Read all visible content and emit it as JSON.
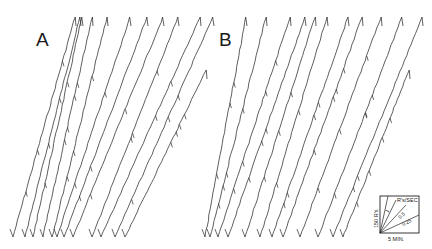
{
  "header": {
    "page_number": "",
    "running_title": ""
  },
  "panels": [
    {
      "label": "A"
    },
    {
      "label": "B"
    }
  ],
  "legend": {
    "y_scale_label": "150 R's",
    "x_scale_label": "5 MIN.",
    "rate_title": "R's/SEC",
    "rate_lines": [
      "1",
      "0.5",
      "0.25"
    ]
  },
  "chart_data": {
    "type": "line",
    "title": "",
    "xlabel": "Time (5 MIN. scale)",
    "ylabel": "Cumulative responses (150 R's scale)",
    "legend_rates_rps": [
      1,
      0.5,
      0.25
    ],
    "series": [
      {
        "name": "A",
        "segments": [
          {
            "top": [
              75,
              17
            ],
            "bottom": [
              13,
              237
            ]
          },
          {
            "top": [
              80,
              17
            ],
            "bottom": [
              25,
              237
            ]
          },
          {
            "top": [
              82,
              17
            ],
            "bottom": [
              33,
              237
            ]
          },
          {
            "top": [
              92,
              17
            ],
            "bottom": [
              43,
              237
            ]
          },
          {
            "top": [
              107,
              17
            ],
            "bottom": [
              52,
              237
            ]
          },
          {
            "top": [
              130,
              17
            ],
            "bottom": [
              57,
              237
            ]
          },
          {
            "top": [
              147,
              17
            ],
            "bottom": [
              64,
              237
            ]
          },
          {
            "top": [
              163,
              17
            ],
            "bottom": [
              73,
              237
            ]
          },
          {
            "top": [
              178,
              17
            ],
            "bottom": [
              92,
              237
            ]
          },
          {
            "top": [
              200,
              17
            ],
            "bottom": [
              101,
              237
            ]
          },
          {
            "top": [
              213,
              17
            ],
            "bottom": [
              115,
              237
            ]
          },
          {
            "top": [
              206,
              70
            ],
            "bottom": [
              125,
              237
            ]
          }
        ]
      },
      {
        "name": "B",
        "segments": [
          {
            "top": [
              246,
              17
            ],
            "bottom": [
              205,
              237
            ]
          },
          {
            "top": [
              266,
              17
            ],
            "bottom": [
              210,
              237
            ]
          },
          {
            "top": [
              290,
              17
            ],
            "bottom": [
              218,
              237
            ]
          },
          {
            "top": [
              305,
              17
            ],
            "bottom": [
              228,
              237
            ]
          },
          {
            "top": [
              315,
              17
            ],
            "bottom": [
              245,
              237
            ]
          },
          {
            "top": [
              327,
              17
            ],
            "bottom": [
              260,
              237
            ]
          },
          {
            "top": [
              348,
              17
            ],
            "bottom": [
              272,
              237
            ]
          },
          {
            "top": [
              362,
              17
            ],
            "bottom": [
              283,
              237
            ]
          },
          {
            "top": [
              381,
              17
            ],
            "bottom": [
              300,
              237
            ]
          },
          {
            "top": [
              402,
              17
            ],
            "bottom": [
              318,
              237
            ]
          },
          {
            "top": [
              422,
              17
            ],
            "bottom": [
              333,
              237
            ]
          },
          {
            "top": [
              409,
              70
            ],
            "bottom": [
              343,
              237
            ]
          }
        ]
      }
    ],
    "grid": false,
    "legend_position": "bottom-right"
  }
}
